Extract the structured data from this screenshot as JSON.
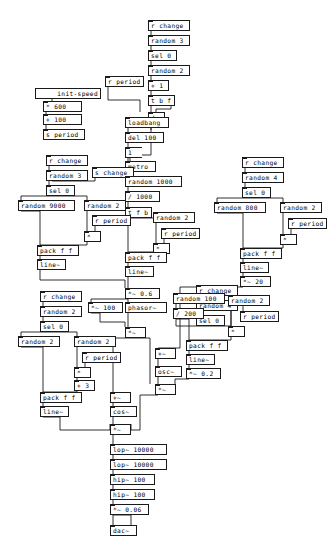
{
  "patch": {
    "title": "Pure Data patch canvas",
    "width": 336,
    "height": 546,
    "background": "#ffffff",
    "box_border": "#1a1a1a",
    "wire_color": "#1a1a1a"
  },
  "controls": {
    "init_toggle_label": "init-speed"
  },
  "objects": [
    {
      "id": "o1",
      "text": "r change",
      "x": 148,
      "y": 20,
      "w": 42,
      "kind": "object"
    },
    {
      "id": "o2",
      "text": "random 3",
      "x": 148,
      "y": 35,
      "w": 42,
      "kind": "object"
    },
    {
      "id": "o3",
      "text": "sel 0",
      "x": 148,
      "y": 50,
      "w": 29,
      "kind": "object"
    },
    {
      "id": "o4",
      "text": "random 2",
      "x": 148,
      "y": 65,
      "w": 42,
      "kind": "object"
    },
    {
      "id": "o5",
      "text": "r period",
      "x": 105,
      "y": 76,
      "w": 39,
      "kind": "object"
    },
    {
      "id": "o6",
      "text": "+ 1",
      "x": 148,
      "y": 80,
      "w": 21,
      "kind": "object"
    },
    {
      "id": "o7",
      "text": "t b f",
      "x": 148,
      "y": 95,
      "w": 27,
      "kind": "object"
    },
    {
      "id": "o8",
      "text": "/",
      "x": 148,
      "y": 112,
      "w": 17,
      "kind": "object"
    },
    {
      "id": "t1",
      "text": "init-speed",
      "x": 47,
      "y": 88,
      "w": 52,
      "kind": "toggle-label"
    },
    {
      "id": "o9",
      "text": "* 600",
      "x": 43,
      "y": 101,
      "w": 39,
      "kind": "object"
    },
    {
      "id": "o10",
      "text": "+ 100",
      "x": 43,
      "y": 114,
      "w": 39,
      "kind": "object"
    },
    {
      "id": "o11",
      "text": "s period",
      "x": 43,
      "y": 129,
      "w": 42,
      "kind": "object"
    },
    {
      "id": "o12",
      "text": "loadbang",
      "x": 125,
      "y": 117,
      "w": 44,
      "kind": "object"
    },
    {
      "id": "o13",
      "text": "del 100",
      "x": 125,
      "y": 132,
      "w": 39,
      "kind": "object"
    },
    {
      "id": "m1",
      "text": "1",
      "x": 125,
      "y": 147,
      "w": 17,
      "kind": "message"
    },
    {
      "id": "o14",
      "text": "metro",
      "x": 125,
      "y": 161,
      "w": 31,
      "kind": "object"
    },
    {
      "id": "o15",
      "text": "r change",
      "x": 46,
      "y": 155,
      "w": 42,
      "kind": "object"
    },
    {
      "id": "o16",
      "text": "random 3",
      "x": 46,
      "y": 170,
      "w": 42,
      "kind": "object"
    },
    {
      "id": "o17",
      "text": "sel 0",
      "x": 46,
      "y": 185,
      "w": 29,
      "kind": "object"
    },
    {
      "id": "o18",
      "text": "s change",
      "x": 92,
      "y": 167,
      "w": 42,
      "kind": "object"
    },
    {
      "id": "o19",
      "text": "random 1000",
      "x": 125,
      "y": 176,
      "w": 57,
      "kind": "object"
    },
    {
      "id": "o20",
      "text": "/ 1000",
      "x": 125,
      "y": 191,
      "w": 35,
      "kind": "object"
    },
    {
      "id": "o21",
      "text": "t f b",
      "x": 125,
      "y": 207,
      "w": 27,
      "kind": "object"
    },
    {
      "id": "o22",
      "text": "random 9000",
      "x": 18,
      "y": 200,
      "w": 57,
      "kind": "object"
    },
    {
      "id": "o23",
      "text": "random 2",
      "x": 84,
      "y": 200,
      "w": 42,
      "kind": "object"
    },
    {
      "id": "o24",
      "text": "r period",
      "x": 92,
      "y": 215,
      "w": 39,
      "kind": "object"
    },
    {
      "id": "o25",
      "text": "*",
      "x": 84,
      "y": 231,
      "w": 17,
      "kind": "object"
    },
    {
      "id": "o26",
      "text": "pack f f",
      "x": 37,
      "y": 245,
      "w": 42,
      "kind": "object"
    },
    {
      "id": "o27",
      "text": "line~",
      "x": 37,
      "y": 259,
      "w": 29,
      "kind": "object"
    },
    {
      "id": "o28",
      "text": "random 2",
      "x": 153,
      "y": 212,
      "w": 42,
      "kind": "object"
    },
    {
      "id": "o29",
      "text": "r period",
      "x": 161,
      "y": 228,
      "w": 39,
      "kind": "object"
    },
    {
      "id": "o30",
      "text": "*",
      "x": 153,
      "y": 243,
      "w": 17,
      "kind": "object"
    },
    {
      "id": "o31",
      "text": "pack f f",
      "x": 125,
      "y": 252,
      "w": 42,
      "kind": "object"
    },
    {
      "id": "o32",
      "text": "line~",
      "x": 125,
      "y": 266,
      "w": 29,
      "kind": "object"
    },
    {
      "id": "o33",
      "text": "*~ 0.6",
      "x": 125,
      "y": 288,
      "w": 35,
      "kind": "object"
    },
    {
      "id": "o34",
      "text": "*~ 100",
      "x": 88,
      "y": 302,
      "w": 35,
      "kind": "object"
    },
    {
      "id": "o35",
      "text": "phasor~",
      "x": 125,
      "y": 302,
      "w": 42,
      "kind": "object"
    },
    {
      "id": "o36",
      "text": "*~",
      "x": 125,
      "y": 327,
      "w": 21,
      "kind": "object"
    },
    {
      "id": "o37",
      "text": "r change",
      "x": 242,
      "y": 157,
      "w": 42,
      "kind": "object"
    },
    {
      "id": "o38",
      "text": "random 4",
      "x": 242,
      "y": 172,
      "w": 42,
      "kind": "object"
    },
    {
      "id": "o39",
      "text": "sel 0",
      "x": 242,
      "y": 187,
      "w": 29,
      "kind": "object"
    },
    {
      "id": "o40",
      "text": "random 800",
      "x": 214,
      "y": 202,
      "w": 52,
      "kind": "object"
    },
    {
      "id": "o41",
      "text": "random 2",
      "x": 280,
      "y": 202,
      "w": 42,
      "kind": "object"
    },
    {
      "id": "o42",
      "text": "r period",
      "x": 288,
      "y": 218,
      "w": 39,
      "kind": "object"
    },
    {
      "id": "o43",
      "text": "*",
      "x": 280,
      "y": 234,
      "w": 17,
      "kind": "object"
    },
    {
      "id": "o44",
      "text": "pack f f",
      "x": 240,
      "y": 248,
      "w": 42,
      "kind": "object"
    },
    {
      "id": "o45",
      "text": "line~",
      "x": 240,
      "y": 262,
      "w": 29,
      "kind": "object"
    },
    {
      "id": "o46",
      "text": "*~ 20",
      "x": 240,
      "y": 276,
      "w": 31,
      "kind": "object"
    },
    {
      "id": "o47",
      "text": "r change",
      "x": 196,
      "y": 285,
      "w": 42,
      "kind": "object"
    },
    {
      "id": "o48",
      "text": "random 4",
      "x": 196,
      "y": 300,
      "w": 42,
      "kind": "object"
    },
    {
      "id": "o49",
      "text": "sel 0",
      "x": 196,
      "y": 315,
      "w": 29,
      "kind": "object"
    },
    {
      "id": "o50",
      "text": "random 100",
      "x": 173,
      "y": 293,
      "w": 52,
      "kind": "object"
    },
    {
      "id": "o51",
      "text": "/ 200",
      "x": 173,
      "y": 308,
      "w": 31,
      "kind": "object"
    },
    {
      "id": "o52",
      "text": "random 2",
      "x": 228,
      "y": 295,
      "w": 42,
      "kind": "object"
    },
    {
      "id": "o53",
      "text": "r period",
      "x": 240,
      "y": 311,
      "w": 39,
      "kind": "object"
    },
    {
      "id": "o54",
      "text": "*",
      "x": 228,
      "y": 326,
      "w": 17,
      "kind": "object"
    },
    {
      "id": "o55",
      "text": "pack f f",
      "x": 186,
      "y": 340,
      "w": 42,
      "kind": "object"
    },
    {
      "id": "o56",
      "text": "line~",
      "x": 186,
      "y": 354,
      "w": 29,
      "kind": "object"
    },
    {
      "id": "o57",
      "text": "*~ 0.2",
      "x": 186,
      "y": 368,
      "w": 35,
      "kind": "object"
    },
    {
      "id": "o58",
      "text": "+~",
      "x": 155,
      "y": 348,
      "w": 21,
      "kind": "object"
    },
    {
      "id": "o59",
      "text": "osc~",
      "x": 155,
      "y": 366,
      "w": 27,
      "kind": "object"
    },
    {
      "id": "o60",
      "text": "*~",
      "x": 155,
      "y": 384,
      "w": 21,
      "kind": "object"
    },
    {
      "id": "o61",
      "text": "r change",
      "x": 40,
      "y": 291,
      "w": 42,
      "kind": "object"
    },
    {
      "id": "o62",
      "text": "random 2",
      "x": 40,
      "y": 306,
      "w": 42,
      "kind": "object"
    },
    {
      "id": "o63",
      "text": "sel 0",
      "x": 40,
      "y": 321,
      "w": 29,
      "kind": "object"
    },
    {
      "id": "o64",
      "text": "random 2",
      "x": 18,
      "y": 336,
      "w": 42,
      "kind": "object"
    },
    {
      "id": "o65",
      "text": "random 2",
      "x": 74,
      "y": 336,
      "w": 42,
      "kind": "object"
    },
    {
      "id": "o66",
      "text": "r period",
      "x": 82,
      "y": 352,
      "w": 39,
      "kind": "object"
    },
    {
      "id": "o67",
      "text": "*",
      "x": 74,
      "y": 367,
      "w": 17,
      "kind": "object"
    },
    {
      "id": "o68",
      "text": "+ 3",
      "x": 74,
      "y": 380,
      "w": 21,
      "kind": "object"
    },
    {
      "id": "o69",
      "text": "pack f f",
      "x": 40,
      "y": 392,
      "w": 42,
      "kind": "object"
    },
    {
      "id": "o70",
      "text": "line~",
      "x": 40,
      "y": 406,
      "w": 29,
      "kind": "object"
    },
    {
      "id": "o71",
      "text": "+~",
      "x": 110,
      "y": 392,
      "w": 21,
      "kind": "object"
    },
    {
      "id": "o72",
      "text": "cos~",
      "x": 110,
      "y": 406,
      "w": 27,
      "kind": "object"
    },
    {
      "id": "o73",
      "text": "*~",
      "x": 110,
      "y": 424,
      "w": 21,
      "kind": "object"
    },
    {
      "id": "o74",
      "text": "lop~ 10000",
      "x": 110,
      "y": 444,
      "w": 57,
      "kind": "object"
    },
    {
      "id": "o75",
      "text": "lop~ 10000",
      "x": 110,
      "y": 459,
      "w": 57,
      "kind": "object"
    },
    {
      "id": "o76",
      "text": "hip~ 100",
      "x": 110,
      "y": 474,
      "w": 45,
      "kind": "object"
    },
    {
      "id": "o77",
      "text": "hip~ 100",
      "x": 110,
      "y": 489,
      "w": 45,
      "kind": "object"
    },
    {
      "id": "o78",
      "text": "*~ 0.06",
      "x": 110,
      "y": 504,
      "w": 39,
      "kind": "object"
    },
    {
      "id": "o79",
      "text": "dac~",
      "x": 110,
      "y": 525,
      "w": 27,
      "kind": "object"
    }
  ],
  "wires": [
    "151,31 151,35",
    "151,46 151,50",
    "151,61 151,65",
    "151,76 151,80",
    "151,91 151,95",
    "151,106 151,112",
    "171,106 171,109 156,109 156,112",
    "108,87 108,100 140,100 140,112",
    "151,123 151,130",
    "52,97 52,101",
    "46,112 46,114",
    "46,125 46,129",
    "128,128 128,132",
    "128,143 128,147",
    "128,158 128,161",
    "151,123 151,155 130,155 130,161",
    "128,172 128,176",
    "128,187 128,191",
    "128,202 128,207",
    "49,166 49,170",
    "49,181 49,185",
    "49,196 21,196 21,200",
    "49,196 87,196 87,200",
    "52,181 95,181 95,167",
    "95,226 95,231",
    "87,211 87,231",
    "87,242 87,245 40,245 40,245",
    "21,211 40,211 40,245",
    "40,256 40,259",
    "128,218 156,218 156,212",
    "164,239 164,243",
    "156,223 156,243",
    "156,254 156,252 128,252 128,252",
    "128,218 128,252",
    "128,263 128,266",
    "128,277 128,288",
    "128,299 128,302",
    "128,299 91,299 91,302",
    "40,270 40,280 125,280 125,288",
    "128,313 128,327",
    "91,313 100,313 100,322 125,322 125,327",
    "245,168 245,172",
    "245,183 245,187",
    "245,198 217,198 217,202",
    "245,198 283,198 283,202",
    "291,229 291,234",
    "283,213 283,234",
    "283,245 283,248 243,248 243,248",
    "217,213 243,213 243,248",
    "243,259 243,262",
    "243,273 243,276",
    "199,296 199,300",
    "199,311 199,315",
    "199,326 176,326 176,293",
    "199,326 231,326 231,295",
    "243,306 243,311",
    "231,306 231,326",
    "231,337 231,340 189,340 189,340",
    "176,319 189,319 189,340",
    "189,351 189,354",
    "189,365 189,368",
    "243,287 180,287 180,348 158,348",
    "158,359 158,366",
    "158,377 158,384",
    "189,379 175,379 175,384",
    "128,338 150,338 150,384",
    "43,302 43,306",
    "43,317 43,321",
    "43,332 21,332 21,336",
    "43,332 77,332 77,336",
    "85,363 85,367",
    "77,347 77,367",
    "77,378 77,380",
    "77,391 77,392 43,392 43,392",
    "21,347 43,347 43,392",
    "43,403 43,406",
    "128,338 113,338 113,392",
    "113,403 113,406",
    "113,417 113,424",
    "43,417 60,417 60,430 110,430 110,424",
    "158,395 140,395 140,430 131,430 131,424",
    "113,435 113,444",
    "113,455 113,459",
    "113,470 113,474",
    "113,485 113,489",
    "113,500 113,504",
    "113,515 113,525",
    "113,515 131,515 131,522 131,525"
  ]
}
